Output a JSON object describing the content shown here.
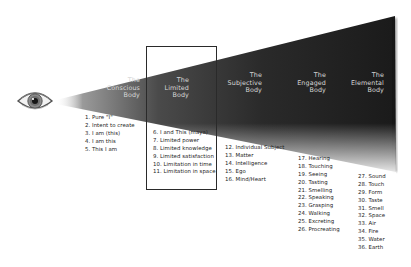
{
  "diagram": {
    "eye_icon": "eye-icon",
    "colors": {
      "cone_dark": "#1c1c1c",
      "cone_light": "#ffffff",
      "label_text": "#d8d8d8",
      "list_text": "#222222",
      "box_border": "#2a2a2a"
    },
    "bodies": [
      {
        "line1": "The",
        "line2": "Conscious",
        "line3": "Body"
      },
      {
        "line1": "The",
        "line2": "Limited",
        "line3": "Body"
      },
      {
        "line1": "The",
        "line2": "Subjective",
        "line3": "Body"
      },
      {
        "line1": "The",
        "line2": "Engaged",
        "line3": "Body"
      },
      {
        "line1": "The",
        "line2": "Elemental",
        "line3": "Body"
      }
    ],
    "lists": [
      {
        "items": [
          "1. Pure \"I\"",
          "2. Intent to create",
          "3. I am (this)",
          "4. I am this",
          "5. This I am"
        ]
      },
      {
        "items": [
          "6. I and This (maya)",
          "7. Limited power",
          "8. Limited knowledge",
          "9. Limited satisfaction",
          "10. Limitation in time",
          "11. Limitation in space"
        ]
      },
      {
        "items": [
          "12. Individual Subject",
          "13. Matter",
          "14. Intelligence",
          "15. Ego",
          "16. Mind/Heart"
        ]
      },
      {
        "items": [
          "17. Hearing",
          "18. Touching",
          "19. Seeing",
          "20. Tasting",
          "21. Smelling",
          "22. Speaking",
          "23. Grasping",
          "24. Walking",
          "25. Excreting",
          "26. Procreating"
        ]
      },
      {
        "items": [
          "27. Sound",
          "28. Touch",
          "29. Form",
          "30. Taste",
          "31. Smell",
          "32. Space",
          "33. Air",
          "34. Fire",
          "35. Water",
          "36. Earth"
        ]
      }
    ]
  }
}
